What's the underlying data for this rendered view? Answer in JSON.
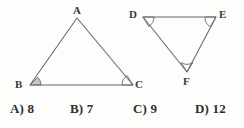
{
  "figure": {
    "stroke_color": "#6b6b6b",
    "background_color": "#fdfdfc",
    "label_color": "#3b3b3b",
    "triangles": [
      {
        "name": "triangle-abc",
        "vertices": [
          {
            "label": "A",
            "x": 77,
            "y": 18,
            "label_x": 73,
            "label_y": 5
          },
          {
            "label": "B",
            "x": 30,
            "y": 85,
            "label_x": 15,
            "label_y": 79
          },
          {
            "label": "C",
            "x": 133,
            "y": 85,
            "label_x": 135,
            "label_y": 79
          }
        ],
        "angle_markers": [
          {
            "at": "B",
            "style": "filled"
          },
          {
            "at": "C",
            "style": "outline"
          }
        ]
      },
      {
        "name": "triangle-def",
        "vertices": [
          {
            "label": "D",
            "x": 143,
            "y": 17,
            "label_x": 129,
            "label_y": 9
          },
          {
            "label": "E",
            "x": 216,
            "y": 17,
            "label_x": 219,
            "label_y": 9
          },
          {
            "label": "F",
            "x": 187,
            "y": 72,
            "label_x": 183,
            "label_y": 76
          }
        ],
        "angle_markers": [
          {
            "at": "D",
            "style": "outline"
          },
          {
            "at": "E",
            "style": "outline"
          },
          {
            "at": "F",
            "style": "outline"
          }
        ]
      }
    ]
  },
  "choices": [
    {
      "id": "a",
      "label": "A) 8",
      "letter": "A",
      "value": "8"
    },
    {
      "id": "b",
      "label": "B) 7",
      "letter": "B",
      "value": "7"
    },
    {
      "id": "c",
      "label": "C) 9",
      "letter": "C",
      "value": "9"
    },
    {
      "id": "d",
      "label": "D) 12",
      "letter": "D",
      "value": "12"
    }
  ]
}
